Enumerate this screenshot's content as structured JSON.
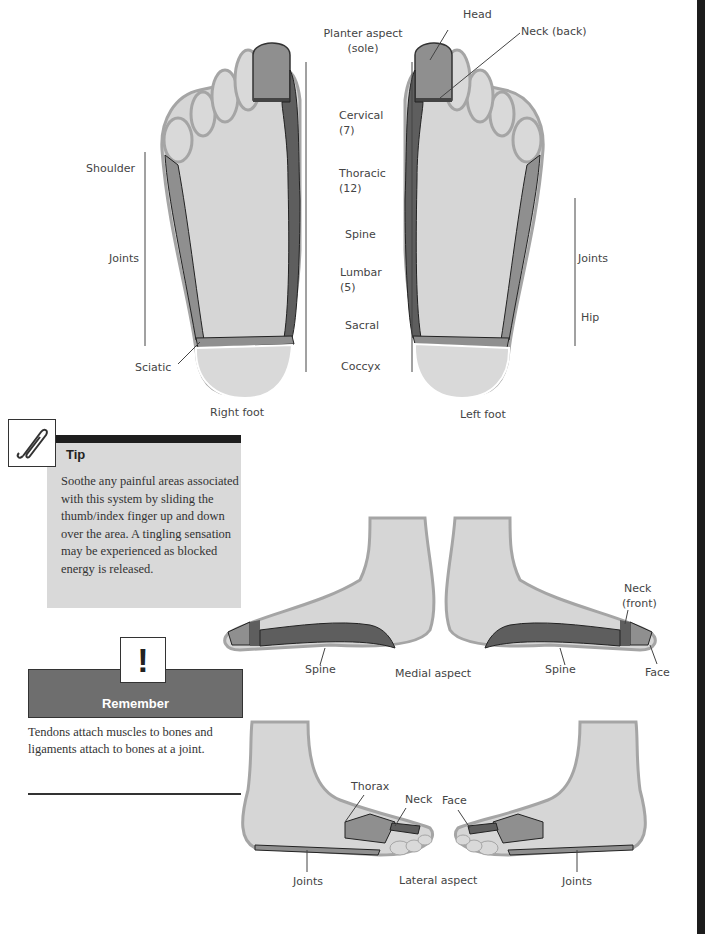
{
  "plantar": {
    "labels": {
      "planter_aspect": "Planter aspect",
      "planter_aspect_sub": "(sole)",
      "cervical": "Cervical",
      "cervical_n": "(7)",
      "thoracic": "Thoracic",
      "thoracic_n": "(12)",
      "spine": "Spine",
      "lumbar": "Lumbar",
      "lumbar_n": "(5)",
      "sacral": "Sacral",
      "coccyx": "Coccyx"
    },
    "right_foot": {
      "caption": "Right foot",
      "shoulder": "Shoulder",
      "joints": "Joints",
      "sciatic": "Sciatic"
    },
    "left_foot": {
      "caption": "Left foot",
      "head": "Head",
      "neck_back": "Neck (back)",
      "joints": "Joints",
      "hip": "Hip"
    }
  },
  "medial": {
    "caption": "Medial aspect",
    "spine_left": "Spine",
    "spine_right": "Spine",
    "neck_front_1": "Neck",
    "neck_front_2": "(front)",
    "face": "Face"
  },
  "lateral": {
    "caption": "Lateral aspect",
    "thorax": "Thorax",
    "neck": "Neck",
    "face": "Face",
    "joints_left": "Joints",
    "joints_right": "Joints"
  },
  "tip": {
    "icon": "paperclip-icon",
    "title": "Tip",
    "text": "Soothe any painful areas associated with this system by sliding the thumb/index finger up and down over the area. A tingling sensation may be experienced as blocked energy is released."
  },
  "remember": {
    "icon_glyph": "!",
    "title": "Remember",
    "text": "Tendons attach muscles to bones and ligaments attach to bones at a joint."
  },
  "colors": {
    "foot_fill": "#d6d6d6",
    "foot_outline": "#a5a5a5",
    "zone_mid": "#8f8f8f",
    "zone_dark": "#5e5e5e",
    "tip_bg": "#d9d9d9",
    "remember_bg": "#6e6e6e"
  }
}
